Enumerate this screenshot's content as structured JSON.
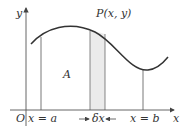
{
  "diagram": {
    "type": "area-under-curve",
    "labels": {
      "y_axis": "y",
      "x_axis": "x",
      "origin": "O",
      "point": "P(x, y)",
      "area": "A",
      "left_bound": "x = a",
      "right_bound": "x = b",
      "strip_width": "δx"
    },
    "colors": {
      "curve": "#333333",
      "axes": "#555555",
      "strip_fill": "#e8e8e8",
      "text": "#333333"
    }
  }
}
